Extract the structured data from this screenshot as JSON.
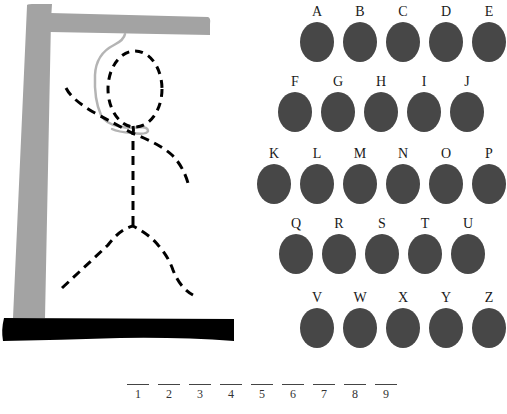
{
  "colors": {
    "gallows": "#a3a3a3",
    "base": "#000000",
    "rope": "#b4b4b4",
    "figure": "#000000",
    "letter_button": "#474747",
    "label": "#1a1a1a"
  },
  "letters": {
    "rows": [
      [
        {
          "label": "A",
          "x": 299,
          "y": 4
        },
        {
          "label": "B",
          "x": 342,
          "y": 4
        },
        {
          "label": "C",
          "x": 385,
          "y": 4
        },
        {
          "label": "D",
          "x": 428,
          "y": 4
        },
        {
          "label": "E",
          "x": 471,
          "y": 4
        }
      ],
      [
        {
          "label": "F",
          "x": 277,
          "y": 74
        },
        {
          "label": "G",
          "x": 320,
          "y": 74
        },
        {
          "label": "H",
          "x": 363,
          "y": 74
        },
        {
          "label": "I",
          "x": 406,
          "y": 74
        },
        {
          "label": "J",
          "x": 449,
          "y": 74
        }
      ],
      [
        {
          "label": "K",
          "x": 256,
          "y": 146
        },
        {
          "label": "L",
          "x": 299,
          "y": 146
        },
        {
          "label": "M",
          "x": 342,
          "y": 146
        },
        {
          "label": "N",
          "x": 385,
          "y": 146
        },
        {
          "label": "O",
          "x": 428,
          "y": 146
        },
        {
          "label": "P",
          "x": 471,
          "y": 146
        }
      ],
      [
        {
          "label": "Q",
          "x": 278,
          "y": 216
        },
        {
          "label": "R",
          "x": 321,
          "y": 216
        },
        {
          "label": "S",
          "x": 364,
          "y": 216
        },
        {
          "label": "T",
          "x": 407,
          "y": 216
        },
        {
          "label": "U",
          "x": 450,
          "y": 216
        }
      ],
      [
        {
          "label": "V",
          "x": 299,
          "y": 290
        },
        {
          "label": "W",
          "x": 342,
          "y": 290
        },
        {
          "label": "X",
          "x": 385,
          "y": 290
        },
        {
          "label": "Y",
          "x": 428,
          "y": 290
        },
        {
          "label": "Z",
          "x": 471,
          "y": 290
        }
      ]
    ]
  },
  "word_slots": [
    {
      "num": "1",
      "x": 127
    },
    {
      "num": "2",
      "x": 158
    },
    {
      "num": "3",
      "x": 189
    },
    {
      "num": "4",
      "x": 220
    },
    {
      "num": "5",
      "x": 251
    },
    {
      "num": "6",
      "x": 282
    },
    {
      "num": "7",
      "x": 313
    },
    {
      "num": "8",
      "x": 344
    },
    {
      "num": "9",
      "x": 375
    }
  ]
}
